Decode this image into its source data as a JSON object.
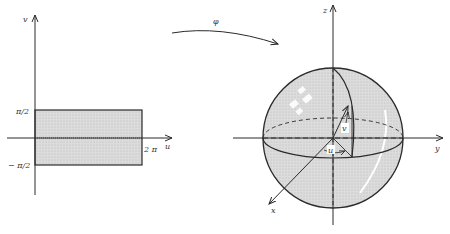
{
  "left_plot": {
    "v_axis_label": "v",
    "u_axis_label": "u",
    "top_tick": "π/2",
    "bottom_tick": "− π/2",
    "right_tick": "2 π"
  },
  "mapping": {
    "label": "φ"
  },
  "sphere": {
    "z_label": "z",
    "y_label": "y",
    "x_label": "x",
    "u_label": "u",
    "v_label": "v"
  },
  "colors": {
    "fill": "#d6d6d6",
    "stroke": "#2a2a2a"
  }
}
